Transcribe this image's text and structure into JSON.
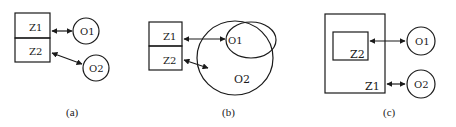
{
  "panels": [
    {
      "caption": "(a)",
      "boxes": [
        "Z1",
        "Z2"
      ],
      "objects": [
        "O1",
        "O2"
      ],
      "relations": [
        {
          "from": "Z1",
          "to": "O1",
          "type": "bidirectional"
        },
        {
          "from": "Z2",
          "to": "O2",
          "type": "bidirectional"
        }
      ]
    },
    {
      "caption": "(b)",
      "boxes": [
        "Z1",
        "Z2"
      ],
      "objects": [
        "O1",
        "O2"
      ],
      "nesting": "O1 inside O2",
      "relations": [
        {
          "from": "Z1",
          "to": "O1",
          "type": "bidirectional"
        },
        {
          "from": "Z2",
          "to": "O2",
          "type": "bidirectional"
        }
      ]
    },
    {
      "caption": "(c)",
      "boxes": [
        "Z1",
        "Z2"
      ],
      "objects": [
        "O1",
        "O2"
      ],
      "nesting": "Z2 inside Z1",
      "relations": [
        {
          "from": "Z2",
          "to": "O1",
          "type": "bidirectional"
        },
        {
          "from": "Z1",
          "to": "O2",
          "type": "bidirectional"
        }
      ]
    }
  ]
}
